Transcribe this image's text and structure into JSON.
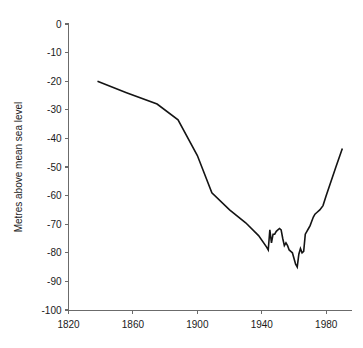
{
  "chart_data": {
    "type": "line",
    "title": "",
    "subtitle": "",
    "xlabel": "",
    "ylabel": "Metres above mean sea level",
    "xlim": [
      1820,
      1996
    ],
    "ylim": [
      -100,
      0
    ],
    "grid": false,
    "legend": null,
    "legend_position": "none",
    "x_ticks": [
      1820,
      1860,
      1900,
      1940,
      1980
    ],
    "x_tick_labels": [
      "1820",
      "1860",
      "1900",
      "1940",
      "1980"
    ],
    "y_ticks": [
      0,
      -10,
      -20,
      -30,
      -40,
      -50,
      -60,
      -70,
      -80,
      -90,
      -100
    ],
    "y_tick_labels": [
      "0",
      "-10",
      "-20",
      "-30",
      "-40",
      "-50",
      "-60",
      "-70",
      "-80",
      "-90",
      "-100"
    ],
    "series": [
      {
        "name": "Lake level",
        "x": [
          1838,
          1856,
          1875,
          1888,
          1900,
          1909,
          1920,
          1930,
          1938,
          1943,
          1944,
          1945,
          1946,
          1947,
          1948,
          1949,
          1950,
          1951,
          1952,
          1953,
          1954,
          1955,
          1956,
          1957,
          1958,
          1959,
          1960,
          1961,
          1962,
          1963,
          1964,
          1965,
          1966,
          1967,
          1968,
          1969,
          1970,
          1971,
          1972,
          1973,
          1974,
          1976,
          1978,
          1980,
          1983,
          1986,
          1990
        ],
        "values": [
          -20,
          -24,
          -28,
          -33.5,
          -46,
          -59,
          -65,
          -69.5,
          -74,
          -78,
          -79,
          -72,
          -76.5,
          -73.5,
          -73.5,
          -72.5,
          -72,
          -71.5,
          -72,
          -75,
          -77.5,
          -76.5,
          -77.5,
          -79,
          -79.5,
          -80,
          -82,
          -84,
          -85,
          -80.5,
          -78.5,
          -80,
          -79.5,
          -73.5,
          -72.5,
          -71.5,
          -70.5,
          -69,
          -67.5,
          -66.5,
          -66,
          -65,
          -63.5,
          -60,
          -55,
          -50,
          -43.5
        ]
      }
    ]
  },
  "axis": {
    "y_title": "Metres above mean sea level"
  }
}
